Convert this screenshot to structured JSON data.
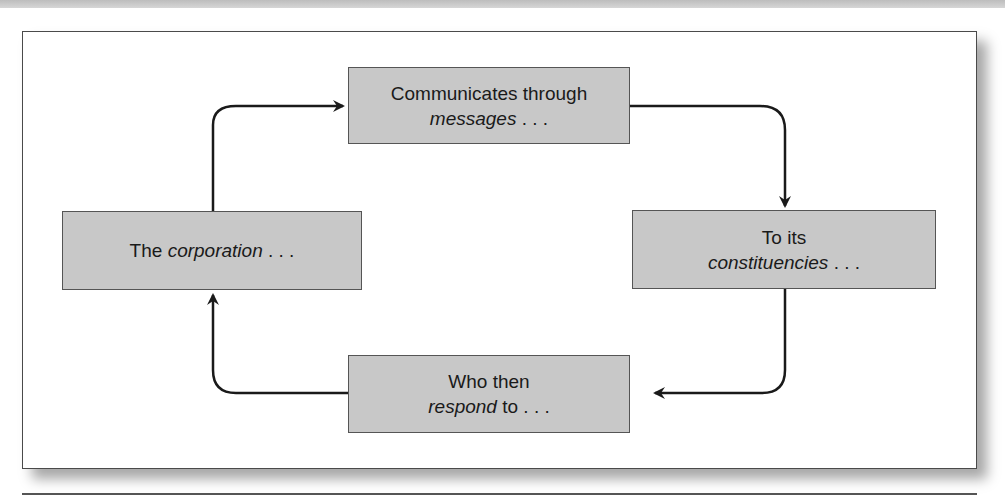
{
  "diagram": {
    "type": "cycle",
    "nodes": [
      {
        "id": "top",
        "line1": "Communicates through",
        "line2_italic": "messages",
        "line2_rest": " . . ."
      },
      {
        "id": "right",
        "line1": "To its",
        "line2_italic": "constituencies",
        "line2_rest": " . . ."
      },
      {
        "id": "bottom",
        "line1": "Who then",
        "line2_italic": "respond",
        "line2_rest": " to . . ."
      },
      {
        "id": "left",
        "line1_plain": "The ",
        "line1_italic": "corporation",
        "line1_rest": " . . ."
      }
    ],
    "edges": [
      {
        "from": "left",
        "to": "top"
      },
      {
        "from": "top",
        "to": "right"
      },
      {
        "from": "right",
        "to": "bottom"
      },
      {
        "from": "bottom",
        "to": "left"
      }
    ],
    "colors": {
      "box_fill": "#c8c8c8",
      "box_border": "#555555",
      "arrow": "#1a1a1a"
    }
  }
}
